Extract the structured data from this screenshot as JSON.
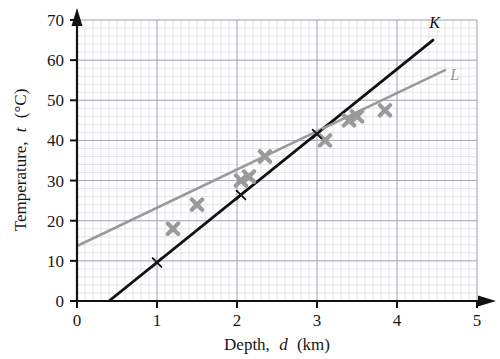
{
  "chart_data": {
    "type": "scatter",
    "title": "",
    "xlabel": "Depth, d (km)",
    "xlabel_parts": {
      "prefix": "Depth,",
      "italic": "d",
      "suffix": "(km)"
    },
    "ylabel": "Temperature, t (°C)",
    "ylabel_parts": {
      "prefix": "Temperature,",
      "italic": "t",
      "suffix": "(°C)"
    },
    "xlim": [
      0,
      5
    ],
    "ylim": [
      0,
      70
    ],
    "xticks": [
      "0",
      "1",
      "2",
      "3",
      "4",
      "5"
    ],
    "yticks": [
      "0",
      "10",
      "20",
      "30",
      "40",
      "50",
      "60",
      "70"
    ],
    "xtick_values": [
      0,
      1,
      2,
      3,
      4,
      5
    ],
    "ytick_values": [
      0,
      10,
      20,
      30,
      40,
      50,
      60,
      70
    ],
    "x_major_step": 1,
    "y_major_step": 10,
    "x_minor_step": 0.1,
    "y_minor_step": 2,
    "grid": true,
    "grid_minor": true,
    "legend": "inline-labels",
    "points": [
      {
        "d": 1.2,
        "t": 18
      },
      {
        "d": 1.5,
        "t": 24
      },
      {
        "d": 2.05,
        "t": 30
      },
      {
        "d": 2.15,
        "t": 31
      },
      {
        "d": 2.35,
        "t": 36
      },
      {
        "d": 3.1,
        "t": 40
      },
      {
        "d": 3.4,
        "t": 45
      },
      {
        "d": 3.5,
        "t": 46
      },
      {
        "d": 3.85,
        "t": 47.5
      }
    ],
    "marker": "x-thick-gray",
    "marker_color": "#9a9a9a",
    "series": [
      {
        "name": "K",
        "label": "K",
        "color": "#111111",
        "type": "line",
        "x0": 0.4,
        "y0": 0,
        "x1": 4.45,
        "y1": 65,
        "tick_marks": [
          {
            "d": 1.0,
            "t": 9.6
          },
          {
            "d": 2.05,
            "t": 26.4
          },
          {
            "d": 3.0,
            "t": 41.6
          }
        ]
      },
      {
        "name": "L",
        "label": "L",
        "color": "#9a9a9a",
        "type": "line",
        "x0": 0.0,
        "y0": 13.7,
        "x1": 4.6,
        "y1": 57.5,
        "tick_marks": []
      }
    ],
    "series_label_positions": [
      {
        "label": "K",
        "d": 4.47,
        "t": 68
      },
      {
        "label": "L",
        "d": 4.72,
        "t": 55
      }
    ],
    "colors": {
      "line_k": "#111111",
      "line_l": "#9a9a9a",
      "marker": "#9a9a9a",
      "axis": "#111111",
      "grid_major": "#a9a9b4",
      "grid_minor": "#d8d8e0",
      "background": "#ffffff"
    }
  }
}
